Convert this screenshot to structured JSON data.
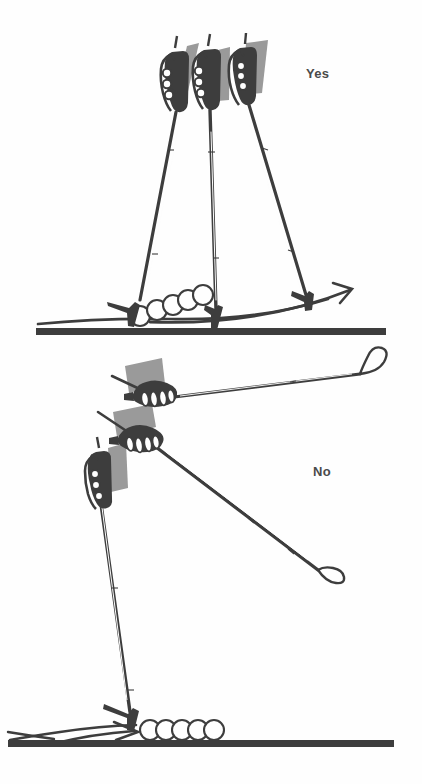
{
  "figure": {
    "background_color": "#fefefe",
    "ink_color": "#3d3d3d",
    "strap_gray": "#9a9a9a",
    "panels": [
      {
        "id": "upper",
        "label": "Yes",
        "label_color": "#4a4a4a",
        "description": "Correct pole plant: three sequential pole positions swing compactly near the ski, tips staying close behind the boot",
        "hand_count": 3,
        "strap_count": 3,
        "motion_circles": 5,
        "has_motion_arc": true,
        "has_arrowhead": true,
        "ground_bar": true
      },
      {
        "id": "lower",
        "label": "No",
        "label_color": "#4a4a4a",
        "description": "Incorrect pole swing: pole carried too far forward and horizontal through the recovery",
        "hand_count": 3,
        "strap_count": 3,
        "motion_circles": 5,
        "has_motion_arc": true,
        "has_arrowhead": true,
        "ground_bar": true
      }
    ]
  },
  "labels": {
    "yes": "Yes",
    "no": "No"
  }
}
